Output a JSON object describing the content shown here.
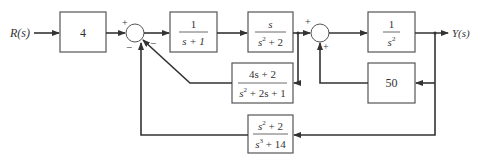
{
  "diagram": {
    "input_label": "R(s)",
    "output_label": "Y(s)",
    "blocks": [
      {
        "id": "gain",
        "text": "4"
      },
      {
        "id": "g1",
        "num": "1",
        "den": "s + 1"
      },
      {
        "id": "g2",
        "num": "s",
        "den_base": "s",
        "den_exp": "2",
        "den_rest": " + 2"
      },
      {
        "id": "g3",
        "num": "1",
        "den_base": "s",
        "den_exp": "2",
        "den_rest": ""
      },
      {
        "id": "h1",
        "num": "4s + 2",
        "den_base": "s",
        "den_exp": "2",
        "den_rest": " + 2s + 1"
      },
      {
        "id": "h2",
        "text": "50"
      },
      {
        "id": "h3",
        "num_base": "s",
        "num_exp": "2",
        "num_rest": " + 2",
        "den_base": "s",
        "den_exp": "3",
        "den_rest": " + 14"
      }
    ],
    "sum1": {
      "top_sign": "+",
      "right_sign": "−",
      "bottom_sign": "−"
    },
    "sum2": {
      "top_sign": "+",
      "bottom_sign": "+"
    }
  }
}
